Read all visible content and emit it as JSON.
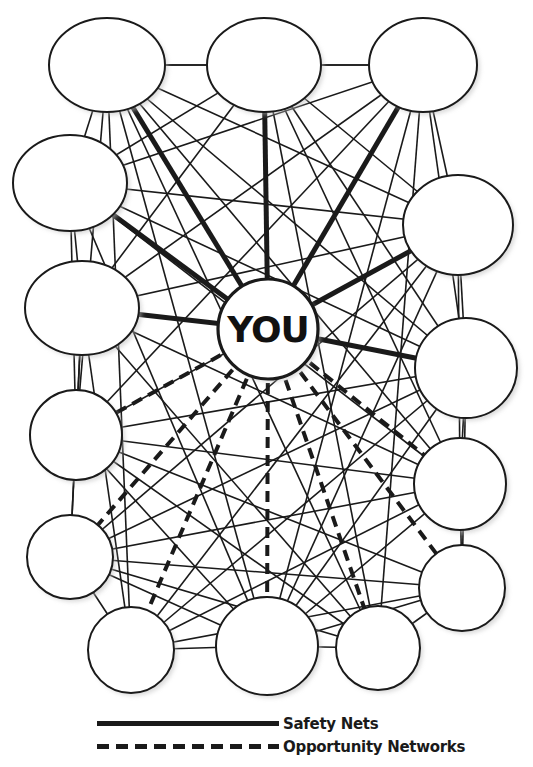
{
  "diagram": {
    "type": "network",
    "center": {
      "id": "you",
      "label": "YOU",
      "x": 268,
      "y": 329,
      "r": 50
    },
    "nodes": [
      {
        "id": "t1",
        "label": "",
        "x": 107,
        "y": 65,
        "rx": 58,
        "ry": 47
      },
      {
        "id": "t2",
        "label": "",
        "x": 264,
        "y": 65,
        "rx": 57,
        "ry": 47
      },
      {
        "id": "t3",
        "label": "",
        "x": 423,
        "y": 65,
        "rx": 54,
        "ry": 47
      },
      {
        "id": "l1",
        "label": "",
        "x": 70,
        "y": 183,
        "rx": 57,
        "ry": 48
      },
      {
        "id": "r1",
        "label": "",
        "x": 458,
        "y": 225,
        "rx": 55,
        "ry": 50
      },
      {
        "id": "l2",
        "label": "",
        "x": 82,
        "y": 308,
        "rx": 57,
        "ry": 47
      },
      {
        "id": "r2",
        "label": "",
        "x": 466,
        "y": 368,
        "rx": 51,
        "ry": 50
      },
      {
        "id": "l3",
        "label": "",
        "x": 76,
        "y": 435,
        "rx": 46,
        "ry": 45
      },
      {
        "id": "r3",
        "label": "",
        "x": 460,
        "y": 484,
        "rx": 46,
        "ry": 46
      },
      {
        "id": "l4",
        "label": "",
        "x": 70,
        "y": 557,
        "rx": 43,
        "ry": 42
      },
      {
        "id": "r4",
        "label": "",
        "x": 462,
        "y": 588,
        "rx": 43,
        "ry": 43
      },
      {
        "id": "b1",
        "label": "",
        "x": 131,
        "y": 650,
        "rx": 43,
        "ry": 43
      },
      {
        "id": "b2",
        "label": "",
        "x": 267,
        "y": 646,
        "rx": 51,
        "ry": 49
      },
      {
        "id": "b3",
        "label": "",
        "x": 378,
        "y": 648,
        "rx": 42,
        "ry": 42
      }
    ],
    "ring_edges": [
      [
        "t1",
        "t2"
      ],
      [
        "t2",
        "t3"
      ],
      [
        "t3",
        "r1"
      ],
      [
        "r1",
        "r2"
      ],
      [
        "r2",
        "r3"
      ],
      [
        "r3",
        "r4"
      ],
      [
        "r4",
        "b3"
      ],
      [
        "b3",
        "b2"
      ],
      [
        "b2",
        "b1"
      ],
      [
        "b1",
        "l4"
      ],
      [
        "l4",
        "l3"
      ],
      [
        "l3",
        "l2"
      ],
      [
        "l2",
        "l1"
      ],
      [
        "l1",
        "t1"
      ]
    ],
    "safety_net_edges": [
      [
        "you",
        "t1"
      ],
      [
        "you",
        "t2"
      ],
      [
        "you",
        "t3"
      ],
      [
        "you",
        "l1"
      ],
      [
        "you",
        "l2"
      ],
      [
        "you",
        "r1"
      ],
      [
        "you",
        "r2"
      ]
    ],
    "opportunity_edges": [
      [
        "you",
        "l3"
      ],
      [
        "you",
        "l4"
      ],
      [
        "you",
        "b1"
      ],
      [
        "you",
        "b2"
      ],
      [
        "you",
        "b3"
      ],
      [
        "you",
        "r3"
      ],
      [
        "you",
        "r4"
      ]
    ],
    "cross_edges": [
      [
        "t1",
        "r1"
      ],
      [
        "t1",
        "r2"
      ],
      [
        "t1",
        "b1"
      ],
      [
        "t1",
        "b2"
      ],
      [
        "t1",
        "l3"
      ],
      [
        "t1",
        "r3"
      ],
      [
        "t1",
        "b3"
      ],
      [
        "t2",
        "l1"
      ],
      [
        "t2",
        "l2"
      ],
      [
        "t2",
        "r1"
      ],
      [
        "t2",
        "r3"
      ],
      [
        "t2",
        "b3"
      ],
      [
        "t2",
        "r2"
      ],
      [
        "t3",
        "l1"
      ],
      [
        "t3",
        "l2"
      ],
      [
        "t3",
        "r2"
      ],
      [
        "t3",
        "b2"
      ],
      [
        "t3",
        "b3"
      ],
      [
        "t3",
        "l3"
      ],
      [
        "t3",
        "t1"
      ],
      [
        "l1",
        "r1"
      ],
      [
        "l1",
        "r2"
      ],
      [
        "l1",
        "b2"
      ],
      [
        "l1",
        "r3"
      ],
      [
        "l1",
        "l3"
      ],
      [
        "l2",
        "r1"
      ],
      [
        "l2",
        "r3"
      ],
      [
        "l2",
        "b3"
      ],
      [
        "l2",
        "l4"
      ],
      [
        "l2",
        "b1"
      ],
      [
        "l3",
        "r2"
      ],
      [
        "l3",
        "r3"
      ],
      [
        "l3",
        "b2"
      ],
      [
        "l3",
        "r1"
      ],
      [
        "l4",
        "r3"
      ],
      [
        "l4",
        "r2"
      ],
      [
        "l4",
        "b2"
      ],
      [
        "l4",
        "r4"
      ],
      [
        "r1",
        "b2"
      ],
      [
        "r1",
        "l4"
      ],
      [
        "r1",
        "b1"
      ],
      [
        "r1",
        "r3"
      ],
      [
        "r2",
        "b1"
      ],
      [
        "r2",
        "b2"
      ],
      [
        "r2",
        "r4"
      ],
      [
        "r3",
        "b1"
      ],
      [
        "r3",
        "b2"
      ],
      [
        "r4",
        "b1"
      ],
      [
        "r4",
        "b2"
      ],
      [
        "r4",
        "l3"
      ],
      [
        "b3",
        "l4"
      ],
      [
        "b3",
        "l3"
      ]
    ]
  },
  "legend": {
    "items": [
      {
        "style": "solid",
        "label": "Safety Nets"
      },
      {
        "style": "dashed",
        "label": "Opportunity Networks"
      }
    ]
  },
  "colors": {
    "line": "#1a1a1a",
    "node_fill": "#ffffff",
    "background": "#ffffff"
  }
}
